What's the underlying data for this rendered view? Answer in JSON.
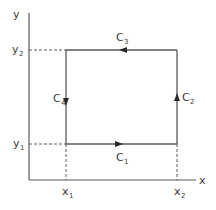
{
  "diagram": {
    "type": "closed-rectangular-path",
    "colors": {
      "line": "#5a5a5a",
      "text": "#3a3a3a",
      "background": "#ffffff"
    },
    "axes": {
      "x_label": "x",
      "y_label": "y"
    },
    "ticks": {
      "x1": {
        "base": "x",
        "sub": "1"
      },
      "x2": {
        "base": "x",
        "sub": "2"
      },
      "y1": {
        "base": "y",
        "sub": "1"
      },
      "y2": {
        "base": "y",
        "sub": "2"
      }
    },
    "segments": [
      {
        "id": "C1",
        "base": "C",
        "sub": "1",
        "from": "(x1,y1)",
        "to": "(x2,y1)",
        "direction": "right"
      },
      {
        "id": "C2",
        "base": "C",
        "sub": "2",
        "from": "(x2,y1)",
        "to": "(x2,y2)",
        "direction": "up"
      },
      {
        "id": "C3",
        "base": "C",
        "sub": "3",
        "from": "(x2,y2)",
        "to": "(x1,y2)",
        "direction": "left"
      },
      {
        "id": "C4",
        "base": "C",
        "sub": "4",
        "from": "(x1,y2)",
        "to": "(x1,y1)",
        "direction": "down"
      }
    ]
  }
}
